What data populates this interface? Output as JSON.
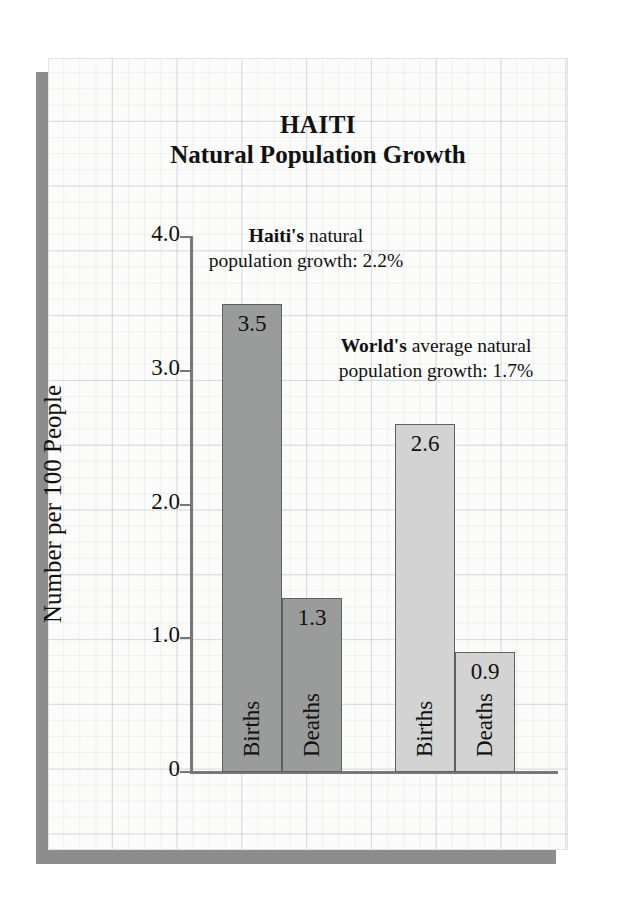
{
  "chart_data": {
    "type": "bar",
    "title": "HAITI",
    "subtitle": "Natural Population Growth",
    "xlabel": "",
    "ylabel": "Number per 100 People",
    "ylim": [
      0,
      4.0
    ],
    "ytick_labels": [
      "4.0",
      "3.0",
      "2.0",
      "1.0",
      "0"
    ],
    "ytick_values": [
      4.0,
      3.0,
      2.0,
      1.0,
      0
    ],
    "grid": true,
    "legend": "none",
    "groups": [
      {
        "name": "Haiti",
        "color": "#9a9b9b",
        "bars": [
          {
            "category": "Births",
            "value": 3.5,
            "label": "3.5"
          },
          {
            "category": "Deaths",
            "value": 1.3,
            "label": "1.3"
          }
        ]
      },
      {
        "name": "World",
        "color": "#d3d3d3",
        "bars": [
          {
            "category": "Births",
            "value": 2.6,
            "label": "2.6"
          },
          {
            "category": "Deaths",
            "value": 0.9,
            "label": "0.9"
          }
        ]
      }
    ],
    "categories": [
      "Births",
      "Deaths",
      "Births",
      "Deaths"
    ],
    "values": [
      3.5,
      1.3,
      2.6,
      0.9
    ],
    "annotations": [
      {
        "id": "haiti",
        "bold_prefix": "Haiti's",
        "text": " natural",
        "line2": "population growth:  2.2%",
        "value": 2.2
      },
      {
        "id": "world",
        "bold_prefix": "World's",
        "text": " average natural",
        "line2": "population growth:  1.7%",
        "value": 1.7
      }
    ]
  },
  "colors": {
    "bar_dark": "#9a9b9b",
    "bar_light": "#d3d3d3",
    "bar_border": "#5f5f5f",
    "axis": "#777777",
    "text": "#111111",
    "panel_bg": "#fbfbfa",
    "shadow": "#8d8d8d"
  }
}
